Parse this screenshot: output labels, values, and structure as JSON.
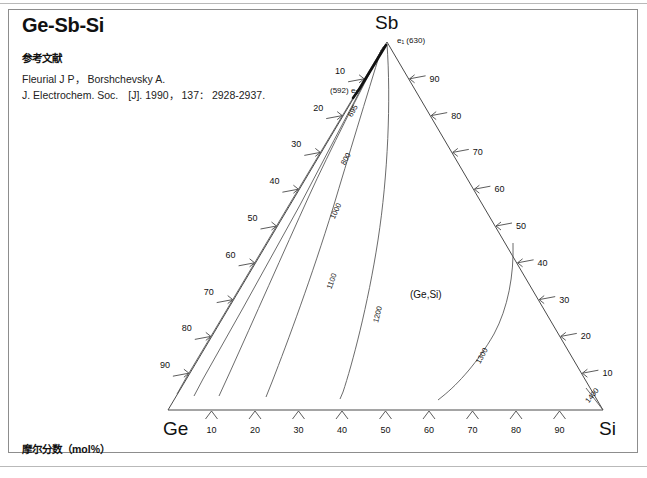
{
  "title": "Ge-Sb-Si",
  "reference": {
    "heading": "参考文献",
    "lines": [
      "Fleurial J P， Borshchevsky A.",
      "J. Electrochem. Soc.　[J]. 1990， 137： 2928-2937."
    ]
  },
  "footnote": "摩尔分数（mol%）",
  "vertices": {
    "top": "Sb",
    "bottom_left": "Ge",
    "bottom_right": "Si"
  },
  "invariant_points": [
    {
      "id": "e1",
      "label": "e₁ (630)",
      "symbol": "e",
      "subscript": "1",
      "temperature": "630"
    },
    {
      "id": "e2",
      "label": "(592) e₂",
      "symbol": "e",
      "subscript": "2",
      "temperature": "592"
    }
  ],
  "phase_field_label": "(Ge,Si)",
  "axis_ticks": {
    "bottom": [
      "10",
      "20",
      "30",
      "40",
      "50",
      "60",
      "70",
      "80",
      "90"
    ],
    "left": [
      "10",
      "20",
      "30",
      "40",
      "50",
      "60",
      "70",
      "80",
      "90"
    ],
    "right": [
      "90",
      "80",
      "70",
      "60",
      "50",
      "40",
      "30",
      "20",
      "10"
    ]
  },
  "chart_data": {
    "type": "line",
    "title": "Ge-Sb-Si",
    "subtitle": "Liquidus projection, ternary phase diagram",
    "xlabel": "摩尔分数（mol%）",
    "ylabel": "",
    "components": [
      "Ge",
      "Sb",
      "Si"
    ],
    "units": "mol%",
    "grid": false,
    "legend": "none",
    "isotherm_unit": "°C",
    "isotherms": [
      {
        "label": "695",
        "temperature": 695,
        "label_pos": {
          "x": 355,
          "y": 112
        }
      },
      {
        "label": "800",
        "temperature": 800,
        "label_pos": {
          "x": 348,
          "y": 160
        }
      },
      {
        "label": "1000",
        "temperature": 1000,
        "label_pos": {
          "x": 338,
          "y": 212
        }
      },
      {
        "label": "1100",
        "temperature": 1100,
        "label_pos": {
          "x": 334,
          "y": 282
        }
      },
      {
        "label": "1200",
        "temperature": 1200,
        "label_pos": {
          "x": 380,
          "y": 315
        }
      },
      {
        "label": "1300",
        "temperature": 1300,
        "label_pos": {
          "x": 484,
          "y": 357
        }
      },
      {
        "label": "1400",
        "temperature": 1400,
        "label_pos": {
          "x": 594,
          "y": 397
        }
      }
    ],
    "boundary_curve": {
      "name": "e1-e2 monovariant boundary",
      "from": "e1",
      "to": "e2",
      "style": "bold"
    },
    "vertex_temperatures": {
      "Sb": 630,
      "Ge": 938,
      "Si": 1414
    }
  }
}
